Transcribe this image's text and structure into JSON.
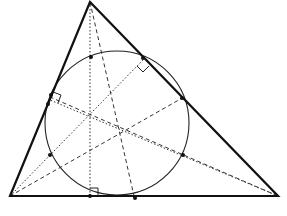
{
  "diagram": {
    "colors": {
      "stroke": "#111111",
      "background": "#ffffff"
    },
    "vertices": {
      "A": [
        90,
        2
      ],
      "B": [
        10,
        196
      ],
      "C": [
        278,
        196
      ]
    },
    "nine_point_circle": {
      "cx": 117,
      "cy": 123,
      "r": 72
    },
    "altitude_feet": {
      "from_A": [
        90,
        196
      ],
      "from_B": [
        143,
        60
      ],
      "from_C": [
        50,
        100
      ]
    },
    "side_midpoints": {
      "BC": [
        134,
        196
      ],
      "CA": [
        184,
        97
      ],
      "AB": [
        50,
        97
      ]
    },
    "euler_segment_midpoints": {
      "AH": [
        90,
        58
      ],
      "BH": [
        50,
        156
      ],
      "CH": [
        184,
        156
      ]
    },
    "orthocenter": [
      90,
      111
    ],
    "centroid": [
      126,
      130
    ],
    "right_angle_marks": [
      "foot_A",
      "foot_B",
      "foot_C"
    ]
  }
}
